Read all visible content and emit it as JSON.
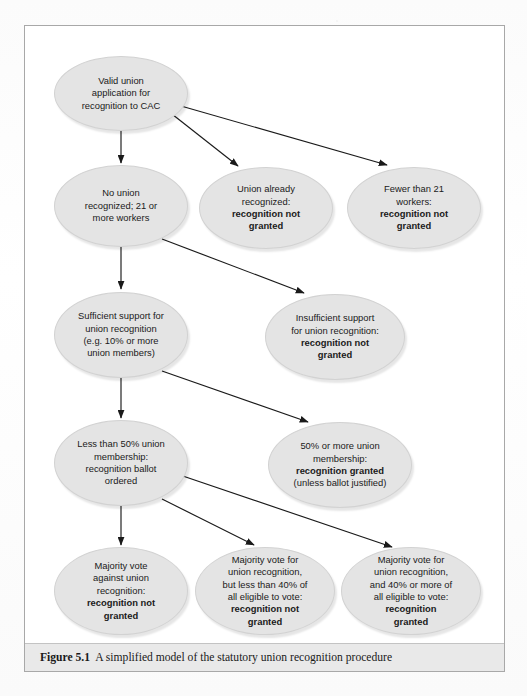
{
  "figure": {
    "caption_label": "Figure 5.1",
    "caption_text": "A simplified model of the statutory union recognition procedure"
  },
  "theme": {
    "node_fill": "#e4e4e4",
    "node_stroke": "#d2d2d2",
    "edge_color": "#1a1a1a",
    "caption_bar_bg": "#e9e9e9",
    "frame_border": "#a8a8a8",
    "page_bg": "#fdfdfd"
  },
  "chart_data": {
    "type": "diagram",
    "title": "A simplified model of the statutory union recognition procedure",
    "nodes": [
      {
        "id": "n1",
        "row": 1,
        "col": 1,
        "shape": "ellipse",
        "lines": [
          "Valid union",
          "application for",
          "recognition to CAC"
        ],
        "bold_lines": []
      },
      {
        "id": "n2",
        "row": 2,
        "col": 1,
        "shape": "ellipse",
        "lines": [
          "No union",
          "recognized; 21 or",
          "more workers"
        ],
        "bold_lines": []
      },
      {
        "id": "n3",
        "row": 2,
        "col": 2,
        "shape": "ellipse",
        "lines": [
          "Union already",
          "recognized:",
          "recognition not",
          "granted"
        ],
        "bold_lines": [
          2,
          3
        ]
      },
      {
        "id": "n4",
        "row": 2,
        "col": 3,
        "shape": "ellipse",
        "lines": [
          "Fewer than 21",
          "workers:",
          "recognition not",
          "granted"
        ],
        "bold_lines": [
          2,
          3
        ]
      },
      {
        "id": "n5",
        "row": 3,
        "col": 1,
        "shape": "ellipse",
        "lines": [
          "Sufficient support for",
          "union recognition",
          "(e.g. 10% or more",
          "union members)"
        ],
        "bold_lines": []
      },
      {
        "id": "n6",
        "row": 3,
        "col": 2,
        "shape": "ellipse",
        "lines": [
          "Insufficient support",
          "for union recognition:",
          "recognition not",
          "granted"
        ],
        "bold_lines": [
          2,
          3
        ]
      },
      {
        "id": "n7",
        "row": 4,
        "col": 1,
        "shape": "ellipse",
        "lines": [
          "Less than 50% union",
          "membership:",
          "recognition ballot",
          "ordered"
        ],
        "bold_lines": []
      },
      {
        "id": "n8",
        "row": 4,
        "col": 2,
        "shape": "ellipse",
        "lines": [
          "50% or more union",
          "membership:",
          "recognition granted",
          "(unless ballot justified)"
        ],
        "bold_lines": [
          2
        ]
      },
      {
        "id": "n9",
        "row": 5,
        "col": 1,
        "shape": "ellipse",
        "lines": [
          "Majority vote",
          "against union",
          "recognition:",
          "recognition not",
          "granted"
        ],
        "bold_lines": [
          3,
          4
        ]
      },
      {
        "id": "n10",
        "row": 5,
        "col": 2,
        "shape": "ellipse",
        "lines": [
          "Majority vote for",
          "union recognition,",
          "but less than 40% of",
          "all eligible to vote:",
          "recognition not",
          "granted"
        ],
        "bold_lines": [
          4,
          5
        ]
      },
      {
        "id": "n11",
        "row": 5,
        "col": 3,
        "shape": "ellipse",
        "lines": [
          "Majority vote for",
          "union recognition,",
          "and 40% or more of",
          "all eligible to vote:",
          "recognition",
          "granted"
        ],
        "bold_lines": [
          4,
          5
        ]
      }
    ],
    "edges": [
      {
        "from": "n1",
        "to": "n2",
        "style": "vertical-arrow"
      },
      {
        "from": "n1",
        "to": "n3",
        "style": "diagonal-arrow"
      },
      {
        "from": "n1",
        "to": "n4",
        "style": "diagonal-arrow"
      },
      {
        "from": "n2",
        "to": "n5",
        "style": "vertical-arrow"
      },
      {
        "from": "n2",
        "to": "n6",
        "style": "diagonal-arrow"
      },
      {
        "from": "n5",
        "to": "n7",
        "style": "vertical-arrow"
      },
      {
        "from": "n5",
        "to": "n8",
        "style": "diagonal-arrow"
      },
      {
        "from": "n7",
        "to": "n9",
        "style": "vertical-arrow"
      },
      {
        "from": "n7",
        "to": "n10",
        "style": "diagonal-arrow"
      },
      {
        "from": "n7",
        "to": "n11",
        "style": "diagonal-arrow"
      }
    ]
  }
}
